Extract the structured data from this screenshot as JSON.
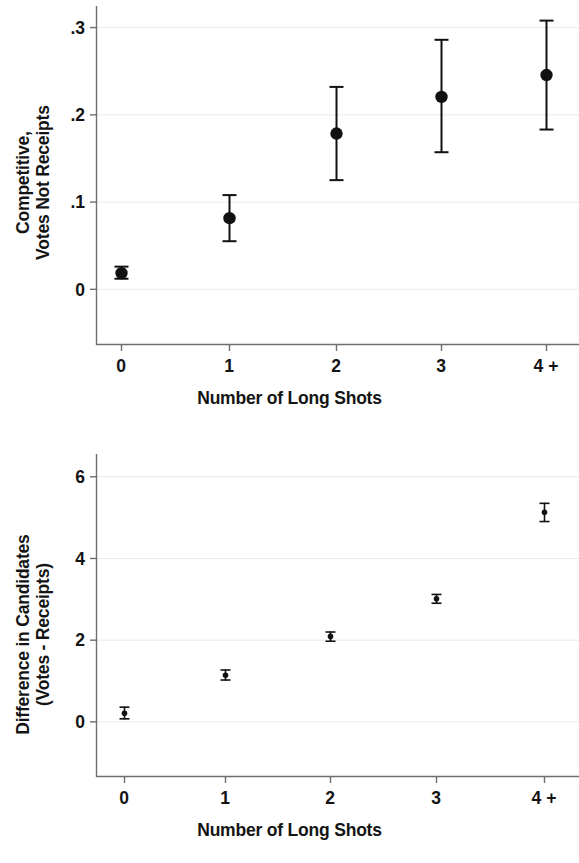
{
  "figure": {
    "background": "#ffffff",
    "ink": "#141414",
    "gridline_color": "#e9e9e9",
    "axis_color": "#6e6e6e",
    "marker_color": "#111111"
  },
  "panels": [
    {
      "id": "panel-top",
      "ylabel_lines": [
        "Competitive,",
        "Votes Not Receipts"
      ],
      "xlabel": "Number of Long Shots"
    },
    {
      "id": "panel-bottom",
      "ylabel_lines": [
        "Difference in Candidates",
        "(Votes - Receipts)"
      ],
      "xlabel": "Number of Long Shots"
    }
  ],
  "chart_data": [
    {
      "type": "scatter",
      "title": "",
      "xlabel": "Number of Long Shots",
      "ylabel": "Competitive, Votes Not Receipts",
      "categories": [
        "0",
        "1",
        "2",
        "3",
        "4 +"
      ],
      "xtick_labels": [
        "0",
        "1",
        "2",
        "3",
        "4 +"
      ],
      "ytick_labels": [
        "0",
        ".1",
        ".2",
        ".3"
      ],
      "ytick_values": [
        0,
        0.1,
        0.2,
        0.3
      ],
      "ylim": [
        -0.03,
        0.315
      ],
      "grid": true,
      "legend": "none",
      "error_bars": "vertical-capped",
      "values": [
        0.018,
        0.081,
        0.178,
        0.22,
        0.245
      ],
      "ci_low": [
        0.011,
        0.054,
        0.124,
        0.156,
        0.182
      ],
      "ci_high": [
        0.026,
        0.108,
        0.232,
        0.286,
        0.308
      ]
    },
    {
      "type": "scatter",
      "title": "",
      "xlabel": "Number of Long Shots",
      "ylabel": "Difference in Candidates (Votes - Receipts)",
      "categories": [
        "0",
        "1",
        "2",
        "3",
        "4 +"
      ],
      "xtick_labels": [
        "0",
        "1",
        "2",
        "3",
        "4 +"
      ],
      "ytick_labels": [
        "0",
        "2",
        "4",
        "6"
      ],
      "ytick_values": [
        0,
        2,
        4,
        6
      ],
      "ylim": [
        -0.75,
        6.35
      ],
      "grid": true,
      "legend": "none",
      "error_bars": "vertical-capped",
      "values": [
        0.2,
        1.13,
        2.08,
        3.0,
        5.12
      ],
      "ci_low": [
        0.05,
        1.0,
        1.95,
        2.88,
        4.88
      ],
      "ci_high": [
        0.36,
        1.27,
        2.2,
        3.12,
        5.35
      ]
    }
  ]
}
